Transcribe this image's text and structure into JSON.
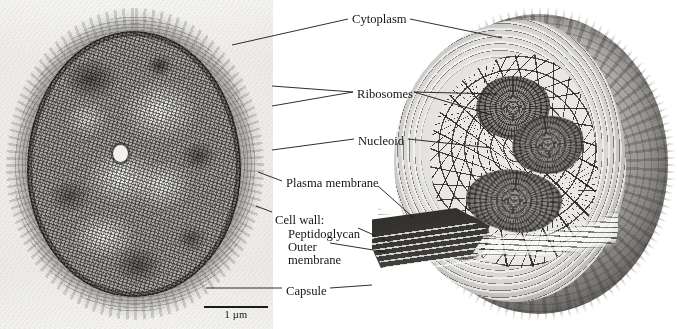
{
  "figure": {
    "panels": [
      {
        "id": "micrograph",
        "kind": "transmission-electron-micrograph",
        "description": "Grayscale TEM cross-section of an oval bacterial cell showing granular cytoplasm, light nucleoid regions, a dark layered cell envelope, and a diffuse outer capsule.",
        "scale_bar": {
          "label": "1 µm",
          "length_px": 64
        }
      },
      {
        "id": "illustration",
        "kind": "cutaway-diagram",
        "description": "Three-dimensional cutaway drawing of the same bacterium with a wedge removed to reveal the layered envelope, stippled cytoplasm with ribosomes, and tangled nucleoid."
      }
    ],
    "labels": [
      {
        "id": "cytoplasm",
        "text": "Cytoplasm",
        "x": 352,
        "y": 13,
        "align": "left"
      },
      {
        "id": "ribosomes",
        "text": "Ribosomes",
        "x": 357,
        "y": 88,
        "align": "left"
      },
      {
        "id": "nucleoid",
        "text": "Nucleoid",
        "x": 358,
        "y": 135,
        "align": "left"
      },
      {
        "id": "plasma-membrane",
        "text": "Plasma membrane",
        "x": 286,
        "y": 177,
        "align": "left"
      },
      {
        "id": "cell-wall",
        "text": "Cell wall:",
        "x": 275,
        "y": 214,
        "align": "left"
      },
      {
        "id": "peptidoglycan",
        "text": "Peptidoglycan",
        "x": 288,
        "y": 228,
        "align": "left"
      },
      {
        "id": "outer-membrane-1",
        "text": "Outer",
        "x": 288,
        "y": 241,
        "align": "left"
      },
      {
        "id": "outer-membrane-2",
        "text": "membrane",
        "x": 288,
        "y": 254,
        "align": "left"
      },
      {
        "id": "capsule",
        "text": "Capsule",
        "x": 286,
        "y": 285,
        "align": "left"
      }
    ],
    "leaders": [
      {
        "for": "cytoplasm",
        "side": "left",
        "path": "M 348 19 L 232 45"
      },
      {
        "for": "cytoplasm",
        "side": "right",
        "path": "M 410 19 L 502 38"
      },
      {
        "for": "ribosomes",
        "side": "left",
        "path": "M 353 92 L 272 86"
      },
      {
        "for": "ribosomes",
        "side": "left",
        "path": "M 353 92 L 272 106"
      },
      {
        "for": "ribosomes",
        "side": "right",
        "path": "M 414 92 L 498 94"
      },
      {
        "for": "ribosomes",
        "side": "right",
        "path": "M 414 92 L 492 115"
      },
      {
        "for": "nucleoid",
        "side": "left",
        "path": "M 354 139 L 272 150"
      },
      {
        "for": "nucleoid",
        "side": "right",
        "path": "M 408 139 L 492 148"
      },
      {
        "for": "plasma-membrane",
        "side": "left",
        "path": "M 282 181 L 258 172"
      },
      {
        "for": "plasma-membrane",
        "side": "right",
        "path": "M 378 186 L 414 218"
      },
      {
        "for": "cell-wall",
        "side": "left",
        "path": "M 272 212 L 256 206"
      },
      {
        "for": "peptidoglycan",
        "side": "right",
        "path": "M 358 228 L 392 243"
      },
      {
        "for": "outer-membrane",
        "side": "right",
        "path": "M 330 243 L 386 252"
      },
      {
        "for": "capsule",
        "side": "left",
        "path": "M 282 288 L 206 288"
      },
      {
        "for": "capsule",
        "side": "right",
        "path": "M 330 288 L 372 285"
      }
    ]
  }
}
